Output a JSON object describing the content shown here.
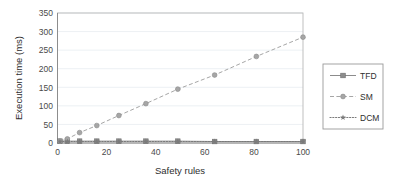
{
  "chart_data": {
    "type": "line",
    "title": "",
    "xlabel": "Safety rules",
    "ylabel": "Execution time (ms)",
    "x": [
      1,
      4,
      9,
      16,
      25,
      36,
      49,
      64,
      81,
      100
    ],
    "series": [
      {
        "name": "TFD",
        "marker": "square",
        "linestyle": "solid",
        "color": "#8c8c8c",
        "values": [
          5,
          5,
          5,
          5,
          5,
          5,
          5,
          4,
          4,
          4
        ]
      },
      {
        "name": "SM",
        "marker": "circle",
        "linestyle": "dashed",
        "color": "#a6a6a6",
        "values": [
          5,
          11,
          28,
          47,
          74,
          106,
          145,
          183,
          233,
          285
        ]
      },
      {
        "name": "DCM",
        "marker": "star",
        "linestyle": "dotted",
        "color": "#7a7a7a",
        "values": [
          4,
          4,
          4,
          4,
          4,
          4,
          4,
          4,
          4,
          4
        ]
      }
    ],
    "xlim": [
      0,
      100
    ],
    "ylim": [
      0,
      350
    ],
    "xticks": [
      "0",
      "20",
      "40",
      "60",
      "80",
      "100"
    ],
    "yticks": [
      "0",
      "50",
      "100",
      "150",
      "200",
      "250",
      "300",
      "350"
    ],
    "grid": "horizontal",
    "legend_position": "right-outside",
    "legend_entries": [
      "TFD",
      "SM",
      "DCM"
    ]
  },
  "legend": {
    "items": [
      {
        "label": "TFD"
      },
      {
        "label": "SM"
      },
      {
        "label": "DCM"
      }
    ]
  },
  "axes": {
    "x_title": "Safety rules",
    "y_title": "Execution time (ms)",
    "x_tick_labels": [
      "0",
      "20",
      "40",
      "60",
      "80",
      "100"
    ],
    "y_tick_labels": [
      "0",
      "50",
      "100",
      "150",
      "200",
      "250",
      "300",
      "350"
    ]
  }
}
